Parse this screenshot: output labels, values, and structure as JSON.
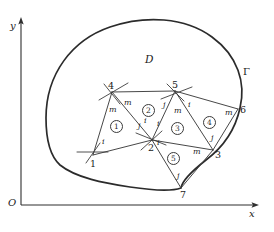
{
  "figure": {
    "region_label": "D",
    "boundary_label": "Γ",
    "origin_label": "O",
    "axis_x_label": "x",
    "axis_y_label": "y"
  },
  "nodes": [
    {
      "id": "1",
      "label": "1",
      "x": 93,
      "y": 155
    },
    {
      "id": "2",
      "label": "2",
      "x": 152,
      "y": 140
    },
    {
      "id": "3",
      "label": "3",
      "x": 213,
      "y": 150
    },
    {
      "id": "4",
      "label": "4",
      "x": 112,
      "y": 92
    },
    {
      "id": "5",
      "label": "5",
      "x": 175,
      "y": 91
    },
    {
      "id": "6",
      "label": "6",
      "x": 238,
      "y": 109
    },
    {
      "id": "7",
      "label": "7",
      "x": 181,
      "y": 188
    }
  ],
  "elements": [
    {
      "number": "①",
      "label": "1",
      "x": 115,
      "y": 125
    },
    {
      "number": "②",
      "label": "2",
      "x": 147,
      "y": 110
    },
    {
      "number": "③",
      "label": "3",
      "x": 176,
      "y": 128
    },
    {
      "number": "④",
      "label": "4",
      "x": 208,
      "y": 122
    },
    {
      "number": "⑤",
      "label": "5",
      "x": 172,
      "y": 158
    }
  ],
  "local_node_labels": [
    {
      "text": "m",
      "x": 113,
      "y": 110
    },
    {
      "text": "m",
      "x": 128,
      "y": 103
    },
    {
      "text": "i",
      "x": 104,
      "y": 142
    },
    {
      "text": "j",
      "x": 140,
      "y": 126
    },
    {
      "text": "i",
      "x": 145,
      "y": 121
    },
    {
      "text": "j",
      "x": 165,
      "y": 105
    },
    {
      "text": "m",
      "x": 176,
      "y": 111
    },
    {
      "text": "i",
      "x": 189,
      "y": 105
    },
    {
      "text": "m",
      "x": 228,
      "y": 113
    },
    {
      "text": "i",
      "x": 158,
      "y": 124
    },
    {
      "text": "j",
      "x": 212,
      "y": 138
    },
    {
      "text": "i",
      "x": 158,
      "y": 143
    },
    {
      "text": "m",
      "x": 195,
      "y": 152
    },
    {
      "text": "j",
      "x": 178,
      "y": 176
    }
  ],
  "axes": {
    "origin": {
      "x": 20,
      "y": 205
    },
    "x_end": {
      "x": 258,
      "y": 205
    },
    "y_end": {
      "x": 20,
      "y": 18
    }
  },
  "colors": {
    "ink": "#1a1a1a",
    "boundary": "#2b2b2b",
    "mesh": "#3d3d3d",
    "background": "#ffffff"
  }
}
